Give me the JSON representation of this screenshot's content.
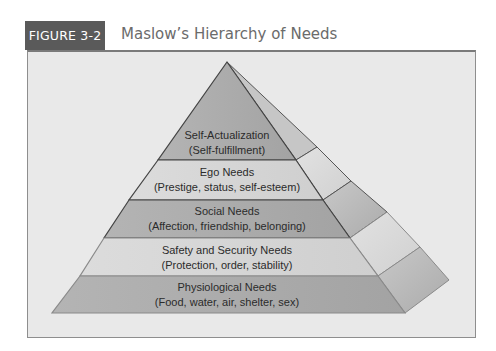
{
  "figure": {
    "label": "FIGURE 3-2",
    "title": "Maslow’s Hierarchy of Needs"
  },
  "colors": {
    "label_bg": "#5a5a5a",
    "title_text": "#6b6b6b",
    "panel_bg": "#e9e9e9",
    "panel_border": "#8e8e8e",
    "layer_dark": "#a9a9a9",
    "layer_light": "#d6d6d6"
  },
  "pyramid": {
    "levels": [
      {
        "name": "Self-Actualization",
        "detail": "(Self-fulfillment)"
      },
      {
        "name": "Ego Needs",
        "detail": "(Prestige, status, self-esteem)"
      },
      {
        "name": "Social Needs",
        "detail": "(Affection, friendship, belonging)"
      },
      {
        "name": "Safety and Security Needs",
        "detail": "(Protection, order, stability)"
      },
      {
        "name": "Physiological Needs",
        "detail": "(Food, water, air, shelter, sex)"
      }
    ]
  }
}
